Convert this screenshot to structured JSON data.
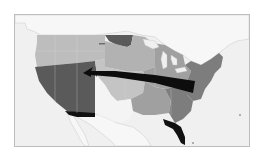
{
  "map": {
    "type": "choropleth",
    "subject": "United States (contiguous)",
    "colors": {
      "background": "#ffffff",
      "water": "#f0f0f0",
      "neighbors": "#f7f7f7",
      "frame_border": "#bdbdbd",
      "darkest": "#111111",
      "dark": "#5a5a5a",
      "medium_dark": "#7d7d7d",
      "medium": "#a0a0a0",
      "light": "#bdbdbd",
      "lightest": "#f4f4f4",
      "arrow": "#0d0d0d"
    },
    "regions": [
      {
        "name": "Southwest (CA, NV, AZ, UT)",
        "shade": "dark"
      },
      {
        "name": "Northwest & Northern Plains",
        "shade": "light"
      },
      {
        "name": "North Dakota / Minnesota area",
        "shade": "dark"
      },
      {
        "name": "Texas / New Mexico",
        "shade": "lightest"
      },
      {
        "name": "Central Plains",
        "shade": "light"
      },
      {
        "name": "Great Lakes / Midwest",
        "shade": "medium"
      },
      {
        "name": "South Central",
        "shade": "medium"
      },
      {
        "name": "Southeast",
        "shade": "medium_dark"
      },
      {
        "name": "Northeast / Mid-Atlantic",
        "shade": "medium_dark"
      },
      {
        "name": "Florida",
        "shade": "darkest"
      },
      {
        "name": "Southern Arizona strip",
        "shade": "darkest"
      }
    ],
    "arrow": {
      "description": "Curved arrow from the Midwest/East westward to Utah",
      "from": "Ohio / Indiana area",
      "to": "Utah / Nevada border"
    }
  }
}
